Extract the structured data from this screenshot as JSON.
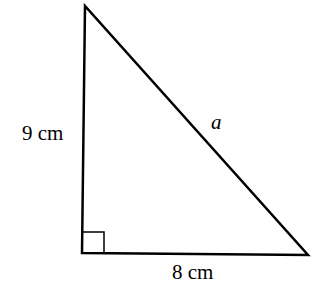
{
  "diagram": {
    "type": "right-triangle",
    "labels": {
      "vertical_side": "9 cm",
      "horizontal_side": "8 cm",
      "hypotenuse": "a"
    },
    "right_angle_marker": true,
    "stroke_color": "#000000",
    "background": "#ffffff"
  }
}
